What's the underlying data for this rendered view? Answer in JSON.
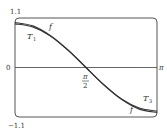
{
  "chart_data": {
    "type": "line",
    "title": "",
    "xlabel": "",
    "ylabel": "",
    "xlim": [
      0,
      3.14159
    ],
    "ylim": [
      -1.1,
      1.1
    ],
    "x_tick_labels": [
      "π/2",
      "π"
    ],
    "y_tick_labels": [
      "1.1",
      "0",
      "-1.1"
    ],
    "grid": false,
    "series": [
      {
        "name": "f",
        "description": "f(x) = cos x",
        "x": [
          0,
          0.393,
          0.785,
          1.178,
          1.571,
          1.963,
          2.356,
          2.749,
          3.142
        ],
        "y": [
          1,
          0.924,
          0.707,
          0.383,
          0,
          -0.383,
          -0.707,
          -0.924,
          -1
        ]
      },
      {
        "name": "T1",
        "description": "Taylor approximation (upper-left)",
        "x": [
          0,
          0.393,
          0.785,
          1.178,
          1.571
        ],
        "y": [
          0.97,
          0.9,
          0.7,
          0.38,
          0
        ]
      },
      {
        "name": "T3",
        "description": "Taylor approximation (lower-right)",
        "x": [
          1.571,
          1.963,
          2.356,
          2.749,
          3.142
        ],
        "y": [
          0,
          -0.38,
          -0.7,
          -0.9,
          -0.97
        ]
      }
    ],
    "annotations": [
      {
        "text": "f",
        "near": "upper curve, left"
      },
      {
        "text": "T1",
        "near": "lower curve, left"
      },
      {
        "text": "T3",
        "near": "upper curve, right"
      },
      {
        "text": "f",
        "near": "lower curve, right"
      }
    ]
  },
  "labels": {
    "y_top": "1.1",
    "y_zero": "0",
    "y_bottom": "−1.1",
    "x_mid_num": "π",
    "x_mid_den": "2",
    "x_end": "π",
    "f_left": "f",
    "t1": "T",
    "t1_sub": "1",
    "t3": "T",
    "t3_sub": "3",
    "f_right": "f"
  }
}
